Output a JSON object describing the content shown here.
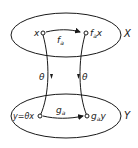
{
  "diagram": {
    "sets": [
      {
        "id": "X",
        "label": "X"
      },
      {
        "id": "Y",
        "label": "Y"
      }
    ],
    "nodes": {
      "x": "x",
      "fax_main": "f",
      "fax_sub": "a",
      "fax_tail": "x",
      "y_eq": "y=θx",
      "gay_main": "g",
      "gay_sub": "a",
      "gay_tail": "y"
    },
    "edges": {
      "f_main": "f",
      "f_sub": "a",
      "g_main": "g",
      "g_sub": "a",
      "theta_left": "θ",
      "theta_right": "θ"
    },
    "colors": {
      "ink": "#1a1a1a",
      "background": "#ffffff"
    }
  }
}
